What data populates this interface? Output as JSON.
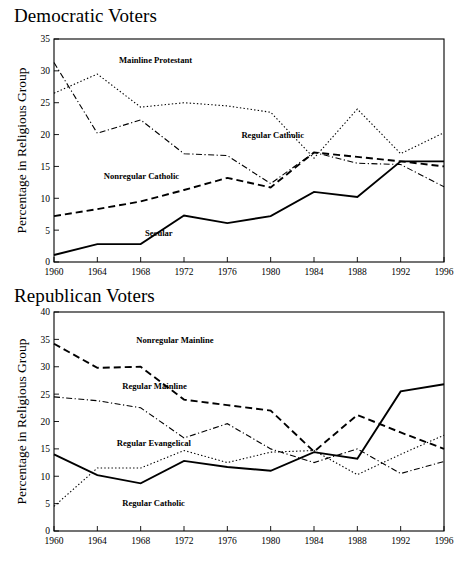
{
  "figures": [
    {
      "id": "democratic",
      "title": "Democratic Voters",
      "ylabel": "Percentage in Religious Group",
      "xlabel": "",
      "yticks": [
        "0",
        "5",
        "10",
        "15",
        "20",
        "25",
        "30",
        "35"
      ],
      "xticks": [
        "1960",
        "1964",
        "1968",
        "1972",
        "1976",
        "1980",
        "1984",
        "1988",
        "1992",
        "1996"
      ],
      "labels": [
        {
          "text": "Mainline Protestant",
          "series": "Mainline Protestant"
        },
        {
          "text": "Regular Catholic",
          "series": "Regular Catholic"
        },
        {
          "text": "Nonregular Catholic",
          "series": "Nonregular Catholic"
        },
        {
          "text": "Secular",
          "series": "Secular"
        }
      ]
    },
    {
      "id": "republican",
      "title": "Republican Voters",
      "ylabel": "Percentage in Religious Group",
      "xlabel": "",
      "yticks": [
        "0",
        "5",
        "10",
        "15",
        "20",
        "25",
        "30",
        "35",
        "40"
      ],
      "xticks": [
        "1960",
        "1964",
        "1968",
        "1972",
        "1976",
        "1980",
        "1984",
        "1988",
        "1992",
        "1996"
      ],
      "labels": [
        {
          "text": "Nonregular Mainline",
          "series": "Nonregular Mainline"
        },
        {
          "text": "Regular Mainline",
          "series": "Regular Mainline"
        },
        {
          "text": "Regular Evangelical",
          "series": "Regular Evangelical"
        },
        {
          "text": "Regular Catholic",
          "series": "Regular Catholic"
        }
      ]
    }
  ],
  "chart_data": [
    {
      "type": "line",
      "title": "Democratic Voters",
      "xlabel": "",
      "ylabel": "Percentage in Religious Group",
      "categories": [
        1960,
        1964,
        1968,
        1972,
        1976,
        1980,
        1984,
        1988,
        1992,
        1996
      ],
      "xlim": [
        1960,
        1996
      ],
      "ylim": [
        0,
        35
      ],
      "ytick_step": 5,
      "grid": false,
      "legend": "inline-annotations",
      "series": [
        {
          "name": "Mainline Protestant",
          "style": "dotted",
          "values": [
            26.5,
            29.5,
            24.3,
            25.0,
            24.5,
            23.5,
            16.3,
            24.0,
            17.0,
            20.3
          ]
        },
        {
          "name": "Regular Catholic",
          "style": "dash-dot",
          "values": [
            31.3,
            20.2,
            22.3,
            17.0,
            16.7,
            12.3,
            17.2,
            15.5,
            15.3,
            11.8
          ]
        },
        {
          "name": "Nonregular Catholic",
          "style": "dashed",
          "values": [
            7.2,
            8.3,
            9.5,
            11.3,
            13.2,
            11.7,
            17.2,
            16.5,
            15.8,
            15.0
          ]
        },
        {
          "name": "Secular",
          "style": "solid",
          "values": [
            1.1,
            2.8,
            2.8,
            7.3,
            6.1,
            7.2,
            11.0,
            10.2,
            15.8,
            15.8
          ]
        }
      ]
    },
    {
      "type": "line",
      "title": "Republican Voters",
      "xlabel": "",
      "ylabel": "Percentage in Religious Group",
      "categories": [
        1960,
        1964,
        1968,
        1972,
        1976,
        1980,
        1984,
        1988,
        1992,
        1996
      ],
      "xlim": [
        1960,
        1996
      ],
      "ylim": [
        0,
        40
      ],
      "ytick_step": 5,
      "grid": false,
      "legend": "inline-annotations",
      "series": [
        {
          "name": "Nonregular Mainline",
          "style": "dashed",
          "values": [
            34.2,
            29.8,
            30.0,
            24.0,
            23.0,
            22.0,
            14.5,
            21.2,
            18.0,
            15.0
          ]
        },
        {
          "name": "Regular Mainline",
          "style": "dash-dot",
          "values": [
            24.5,
            23.8,
            22.5,
            17.0,
            19.6,
            15.0,
            12.5,
            15.0,
            10.5,
            12.7
          ]
        },
        {
          "name": "Regular Evangelical",
          "style": "solid",
          "values": [
            14.0,
            10.2,
            8.7,
            12.8,
            11.7,
            11.0,
            14.4,
            13.2,
            25.5,
            26.8
          ]
        },
        {
          "name": "Regular Catholic",
          "style": "dotted",
          "values": [
            4.5,
            11.5,
            11.5,
            14.7,
            12.5,
            14.4,
            14.7,
            10.3,
            14.0,
            17.5
          ]
        }
      ]
    }
  ],
  "annotations": {
    "democratic": [
      {
        "text": "Mainline Protestant",
        "x": 1966.0,
        "y": 31.2
      },
      {
        "text": "Regular Catholic",
        "x": 1977.3,
        "y": 19.4
      },
      {
        "text": "Nonregular Catholic",
        "x": 1964.6,
        "y": 13.0
      },
      {
        "text": "Secular",
        "x": 1968.4,
        "y": 4.1
      }
    ],
    "republican": [
      {
        "text": "Nonregular Mainline",
        "x": 1967.6,
        "y": 34.3
      },
      {
        "text": "Regular Mainline",
        "x": 1966.3,
        "y": 26.0
      },
      {
        "text": "Regular Evangelical",
        "x": 1965.8,
        "y": 15.6
      },
      {
        "text": "Regular Catholic",
        "x": 1966.3,
        "y": 4.5
      }
    ]
  }
}
